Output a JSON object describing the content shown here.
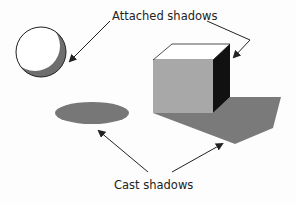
{
  "labels": {
    "attached": "Attached shadows",
    "cast": "Cast shadows"
  },
  "objects": {
    "sphere": {
      "name": "sphere",
      "fill": "#ffffff",
      "shadow": "#6e6e6e"
    },
    "ellipse_shadow": {
      "name": "cast shadow ellipse",
      "fill": "#777777"
    },
    "cube": {
      "top": "#ffffff",
      "front": "#a8a8a8",
      "side": "#111111",
      "cast_shadow": "#7a7a7a"
    }
  },
  "colors": {
    "background": "#fdfdfd",
    "stroke": "#222222"
  }
}
